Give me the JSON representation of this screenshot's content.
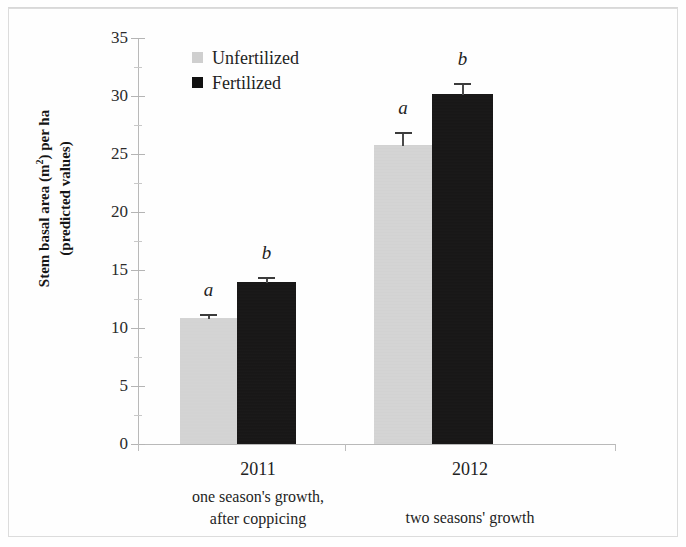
{
  "chart_data": {
    "type": "bar",
    "title": "",
    "subtitle": "",
    "xlabel": "",
    "ylabel": "Stem basal area (m²) per ha (predicted values)",
    "ylabel_line1": "Stem basal area (m",
    "ylabel_sup": "2",
    "ylabel_line1_end": ") per ha",
    "ylabel_line2": "(predicted values)",
    "categories": [
      "2011",
      "2012"
    ],
    "category_captions": [
      "one season's growth, after coppicing",
      "two seasons' growth"
    ],
    "series": [
      {
        "name": "Unfertilized",
        "color": "#d2d2d2",
        "values": [
          10.9,
          25.8
        ],
        "errors": [
          0.35,
          1.1
        ],
        "letters": [
          "a",
          "a"
        ]
      },
      {
        "name": "Fertilized",
        "color": "#111111",
        "values": [
          14.0,
          30.2
        ],
        "errors": [
          0.4,
          0.9
        ],
        "letters": [
          "b",
          "b"
        ]
      }
    ],
    "ylim": [
      0,
      35
    ],
    "ytick_values": [
      0,
      5,
      10,
      15,
      20,
      25,
      30,
      35
    ],
    "ytick_labels": [
      "0",
      "5",
      "10",
      "15",
      "20",
      "25",
      "30",
      "35"
    ],
    "yminor_values": [
      2.5,
      7.5,
      12.5,
      17.5,
      22.5,
      27.5,
      32.5
    ],
    "grid": false,
    "legend_position": "top-left-inside",
    "error_bar_type": "upper-cap-only"
  },
  "legend": {
    "items": [
      {
        "label": "Unfertilized",
        "swatch": "gray-square-icon"
      },
      {
        "label": "Fertilized",
        "swatch": "black-square-icon"
      }
    ]
  },
  "axis": {
    "y_title_line1_a": "Stem basal area (m",
    "y_title_line1_sup": "2",
    "y_title_line1_b": ") per ha",
    "y_title_line2": "(predicted values)"
  },
  "groups": [
    {
      "year": "2011",
      "caption_line1": "one season's growth,",
      "caption_line2": "after coppicing"
    },
    {
      "year": "2012",
      "caption_line1": "two seasons' growth",
      "caption_line2": ""
    }
  ],
  "colors": {
    "unfertilized": "#d2d2d2",
    "fertilized": "#111111",
    "axis": "#b9b9b9",
    "text": "#1c1c1c",
    "frame": "#dcdcdc"
  }
}
